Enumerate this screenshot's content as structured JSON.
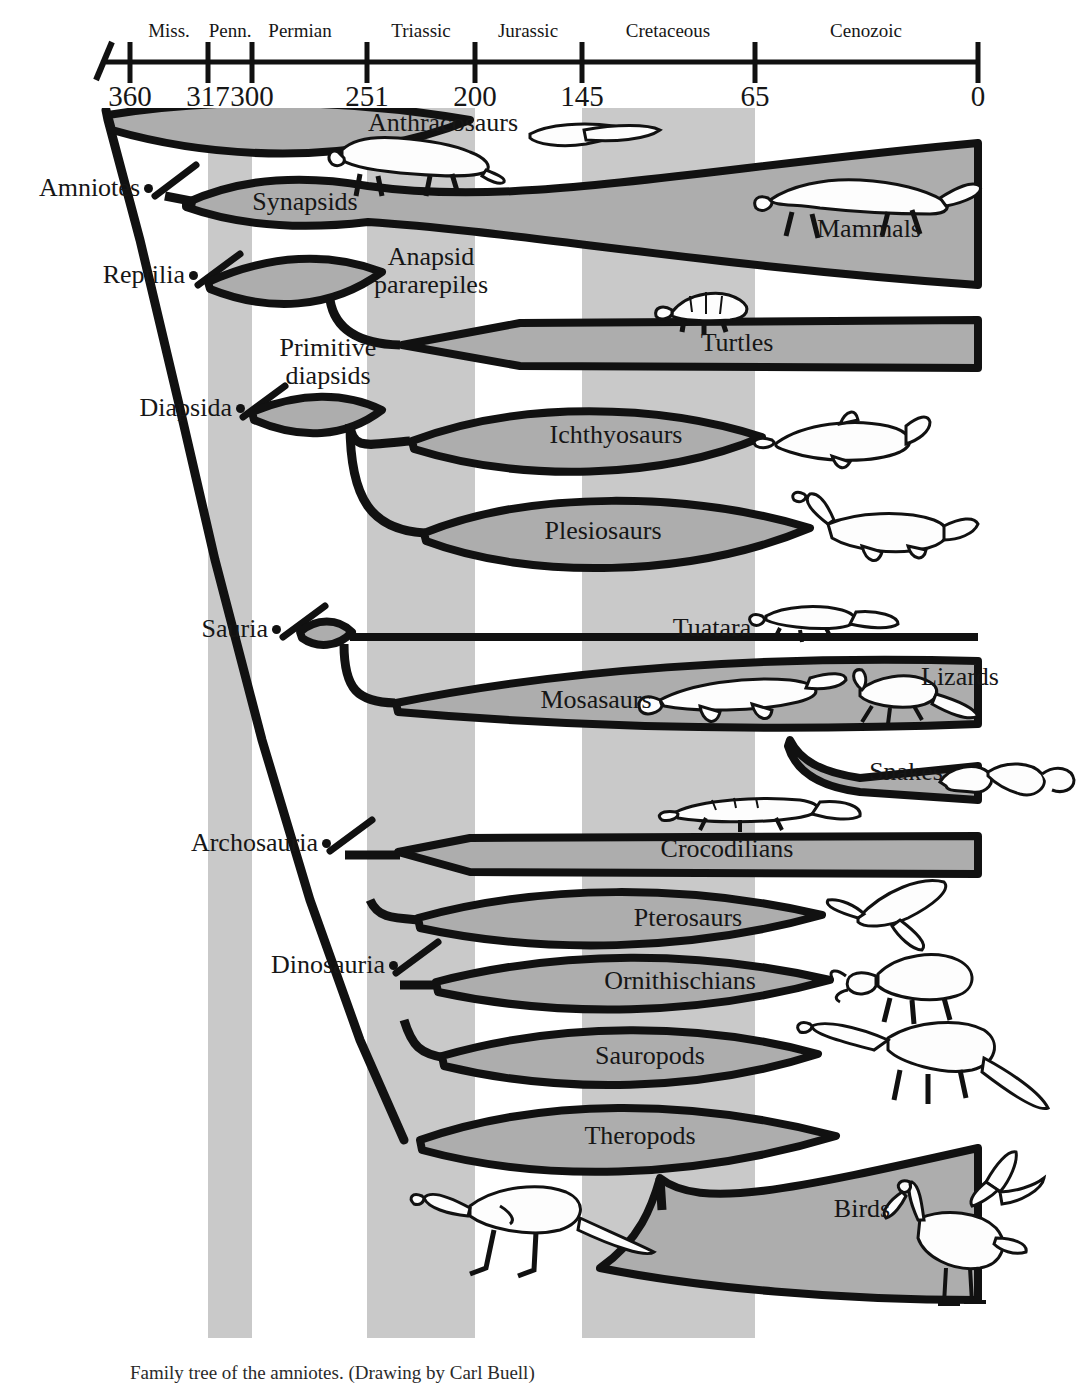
{
  "figure": {
    "caption": "Family tree of the amniotes. (Drawing by Carl Buell)",
    "band_color": "#c9c9c9",
    "clade_fill": "#adadad",
    "line_color": "#111111"
  },
  "timeline": {
    "axis_label_unit": "millions of years ago",
    "ticks": [
      {
        "value": "360",
        "x": 130
      },
      {
        "value": "317",
        "x": 208
      },
      {
        "value": "300",
        "x": 252
      },
      {
        "value": "251",
        "x": 367
      },
      {
        "value": "200",
        "x": 475
      },
      {
        "value": "145",
        "x": 582
      },
      {
        "value": "65",
        "x": 755
      },
      {
        "value": "0",
        "x": 978
      }
    ],
    "periods": [
      {
        "label": "Miss.",
        "x": 169,
        "shaded": false
      },
      {
        "label": "Penn.",
        "x": 230,
        "shaded": true
      },
      {
        "label": "Permian",
        "x": 300,
        "shaded": false
      },
      {
        "label": "Triassic",
        "x": 421,
        "shaded": true
      },
      {
        "label": "Jurassic",
        "x": 528,
        "shaded": false
      },
      {
        "label": "Cretaceous",
        "x": 668,
        "shaded": true
      },
      {
        "label": "Cenozoic",
        "x": 866,
        "shaded": false
      }
    ]
  },
  "clades": [
    {
      "label": "Amniotes",
      "x": 140,
      "y": 190
    },
    {
      "label": "Reptilia",
      "x": 185,
      "y": 277
    },
    {
      "label": "Diapsida",
      "x": 232,
      "y": 410
    },
    {
      "label": "Sauria",
      "x": 268,
      "y": 631
    },
    {
      "label": "Archosauria",
      "x": 318,
      "y": 845
    },
    {
      "label": "Dinosauria",
      "x": 385,
      "y": 967
    }
  ],
  "taxa": [
    {
      "label": "Anthracosaurs",
      "x": 443,
      "y": 125,
      "icon": "labyrinthodont-icon"
    },
    {
      "label": "Synapsids",
      "x": 305,
      "y": 204,
      "icon": "synapsid-icon"
    },
    {
      "label": "Mammals",
      "x": 869,
      "y": 231,
      "icon": "cheetah-icon"
    },
    {
      "label": "Anapsid\npararepiles",
      "x": 431,
      "y": 273,
      "icon": "none"
    },
    {
      "label": "Turtles",
      "x": 737,
      "y": 345,
      "icon": "tortoise-icon"
    },
    {
      "label": "Primitive\ndiapsids",
      "x": 328,
      "y": 364,
      "icon": "none"
    },
    {
      "label": "Ichthyosaurs",
      "x": 616,
      "y": 437,
      "icon": "ichthyosaur-icon"
    },
    {
      "label": "Plesiosaurs",
      "x": 603,
      "y": 533,
      "icon": "plesiosaur-icon"
    },
    {
      "label": "Tuatara",
      "x": 712,
      "y": 630,
      "icon": "tuatara-icon"
    },
    {
      "label": "Mosasaurs",
      "x": 596,
      "y": 702,
      "icon": "mosasaur-icon"
    },
    {
      "label": "Lizards",
      "x": 960,
      "y": 679,
      "icon": "lizard-icon"
    },
    {
      "label": "Snakes",
      "x": 906,
      "y": 774,
      "icon": "snake-icon"
    },
    {
      "label": "Crocodilians",
      "x": 727,
      "y": 851,
      "icon": "crocodile-icon"
    },
    {
      "label": "Pterosaurs",
      "x": 688,
      "y": 920,
      "icon": "pterosaur-icon"
    },
    {
      "label": "Ornithischians",
      "x": 680,
      "y": 983,
      "icon": "triceratops-icon"
    },
    {
      "label": "Sauropods",
      "x": 650,
      "y": 1058,
      "icon": "sauropod-icon"
    },
    {
      "label": "Theropods",
      "x": 640,
      "y": 1138,
      "icon": "theropod-icon"
    },
    {
      "label": "Birds",
      "x": 862,
      "y": 1211,
      "icon": "bird-icon"
    }
  ]
}
